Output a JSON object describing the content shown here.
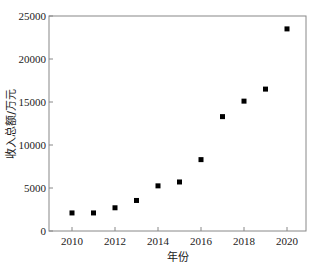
{
  "chart_data": {
    "type": "scatter",
    "title": "",
    "xlabel": "年份",
    "ylabel": "收入总额/万元",
    "x": [
      2010,
      2011,
      2012,
      2013,
      2014,
      2015,
      2016,
      2017,
      2018,
      2019,
      2020
    ],
    "values": [
      2100,
      2100,
      2700,
      3550,
      5250,
      5700,
      8300,
      13300,
      15100,
      16500,
      23500
    ],
    "xlim": [
      2009.3,
      2021
    ],
    "ylim": [
      0,
      25000
    ],
    "xticks": [
      2010,
      2012,
      2014,
      2016,
      2018,
      2020
    ],
    "yticks": [
      0,
      5000,
      10000,
      15000,
      20000,
      25000
    ],
    "grid": false,
    "legend": null,
    "marker": "square",
    "marker_color": "#000000"
  }
}
